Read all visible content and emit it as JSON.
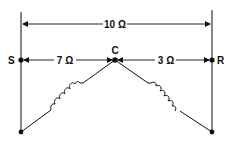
{
  "diagram": {
    "type": "wye-connected windings with resistance measurements",
    "terminals": [
      {
        "id": "S",
        "label": "S"
      },
      {
        "id": "C",
        "label": "C"
      },
      {
        "id": "R",
        "label": "R"
      }
    ],
    "measurements": [
      {
        "from": "S",
        "to": "R",
        "label": "10 Ω"
      },
      {
        "from": "S",
        "to": "C",
        "label": "7 Ω"
      },
      {
        "from": "C",
        "to": "R",
        "label": "3 Ω"
      }
    ],
    "colors": {
      "line": "#111111",
      "background": "#ffffff"
    }
  }
}
